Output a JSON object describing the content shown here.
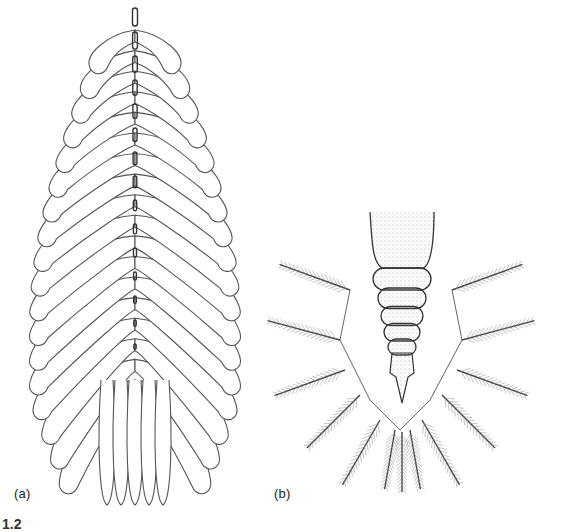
{
  "figure": {
    "panels": [
      {
        "id": "a",
        "label": "(a)",
        "subject": "feather-like lamella with segmented central axis and paired overlapping lobes"
      },
      {
        "id": "b",
        "label": "(b)",
        "subject": "segmented tapering body flanked by a V-shaped row of plumose appendages"
      }
    ],
    "caption_fragment": "1.2",
    "colors": {
      "background": "#ffffff",
      "line": "#444444",
      "stipple": "#777777"
    },
    "panel_a": {
      "lobe_pairs": 18,
      "axis_segments": 15
    },
    "panel_b": {
      "body_segments": 6,
      "appendages_per_side": 5,
      "center_appendages": 3
    }
  }
}
